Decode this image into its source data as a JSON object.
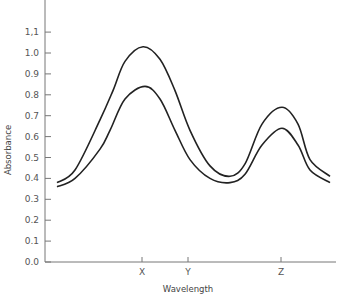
{
  "chart_data": {
    "type": "line",
    "title": "",
    "xlabel": "Wavelength",
    "ylabel": "Absorbance",
    "ylim": [
      0.0,
      1.25
    ],
    "yticks": [
      "0.0",
      "0.1",
      "0.2",
      "0.3",
      "0.4",
      "0.5",
      "0.6",
      "0.7",
      "0.8",
      "0.9",
      "1.0",
      "1,1"
    ],
    "xticks": [
      {
        "label": "X",
        "pos": 142
      },
      {
        "label": "Y",
        "pos": 188
      },
      {
        "label": "Z",
        "pos": 281
      }
    ],
    "grid": false,
    "legend": null,
    "series": [
      {
        "name": "upper curve",
        "x_px": [
          57,
          75,
          100,
          113,
          125,
          143,
          160,
          175,
          190,
          210,
          230,
          245,
          262,
          282,
          298,
          310,
          330
        ],
        "values": [
          0.38,
          0.44,
          0.68,
          0.82,
          0.96,
          1.03,
          0.97,
          0.82,
          0.63,
          0.46,
          0.41,
          0.47,
          0.66,
          0.74,
          0.66,
          0.49,
          0.41
        ]
      },
      {
        "name": "lower curve",
        "x_px": [
          57,
          75,
          100,
          110,
          125,
          145,
          160,
          175,
          190,
          210,
          230,
          245,
          262,
          282,
          298,
          310,
          330
        ],
        "values": [
          0.36,
          0.4,
          0.54,
          0.63,
          0.78,
          0.84,
          0.78,
          0.63,
          0.49,
          0.4,
          0.38,
          0.42,
          0.56,
          0.64,
          0.56,
          0.44,
          0.38
        ]
      }
    ],
    "annotations": []
  },
  "layout": {
    "plot_left": 45,
    "plot_bottom": 262,
    "plot_right": 336,
    "px_per_unit": 209,
    "line_color": "#222222",
    "axis_color": "#777777"
  }
}
